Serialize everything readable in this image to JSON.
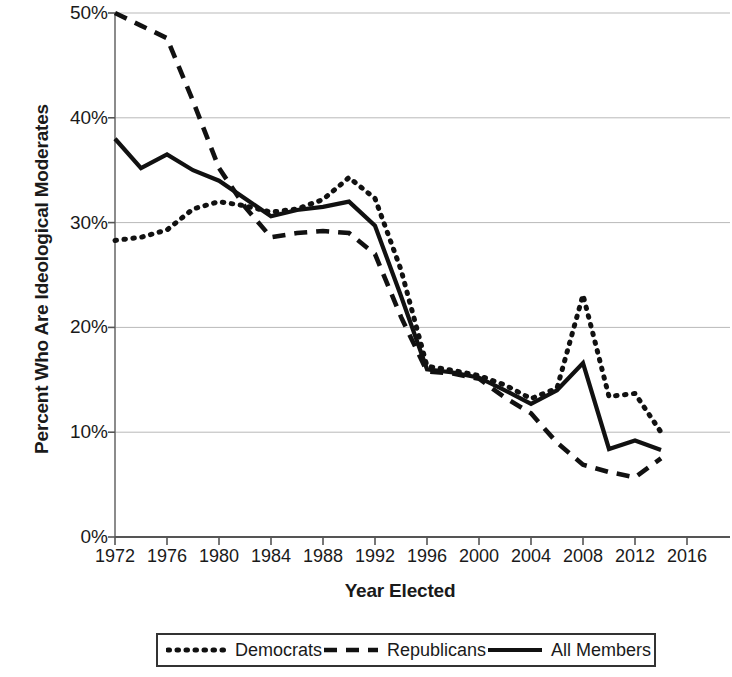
{
  "chart_data": {
    "type": "line",
    "title": "",
    "xlabel": "Year Elected",
    "ylabel": "Percent Who Are Ideological Moderates",
    "xlim": [
      1972,
      2016
    ],
    "ylim": [
      0,
      50
    ],
    "grid": true,
    "grid_axis": "y",
    "legend_position": "bottom",
    "x_tick_labels": [
      "1972",
      "1976",
      "1980",
      "1984",
      "1988",
      "1992",
      "1996",
      "2000",
      "2004",
      "2008",
      "2012",
      "2016"
    ],
    "x_ticks": [
      1972,
      1976,
      1980,
      1984,
      1988,
      1992,
      1996,
      2000,
      2004,
      2008,
      2012,
      2016
    ],
    "y_tick_labels": [
      "0%",
      "10%",
      "20%",
      "30%",
      "40%",
      "50%"
    ],
    "y_ticks": [
      0,
      10,
      20,
      30,
      40,
      50
    ],
    "x": [
      1972,
      1974,
      1976,
      1978,
      1980,
      1982,
      1984,
      1986,
      1988,
      1990,
      1992,
      1994,
      1996,
      1998,
      2000,
      2002,
      2004,
      2006,
      2008,
      2010,
      2012,
      2014
    ],
    "series": [
      {
        "name": "Democrats",
        "style": "dotted",
        "color": "#111111",
        "values": [
          28.3,
          28.6,
          29.3,
          31.3,
          32.0,
          31.6,
          31.0,
          31.3,
          32.2,
          34.3,
          32.3,
          25.5,
          16.3,
          15.9,
          15.4,
          14.5,
          13.2,
          14.2,
          23.1,
          13.4,
          13.7,
          10.0
        ]
      },
      {
        "name": "Republicans",
        "style": "dashed",
        "color": "#111111",
        "values": [
          50.0,
          48.8,
          47.6,
          41.6,
          35.2,
          31.5,
          28.6,
          29.0,
          29.2,
          29.0,
          27.0,
          21.0,
          15.8,
          15.6,
          15.1,
          13.3,
          11.8,
          9.0,
          6.9,
          6.2,
          5.7,
          7.5
        ]
      },
      {
        "name": "All Members",
        "style": "solid",
        "color": "#111111",
        "values": [
          38.0,
          35.2,
          36.5,
          35.0,
          34.0,
          32.3,
          30.6,
          31.2,
          31.5,
          32.0,
          29.7,
          23.0,
          16.0,
          15.7,
          15.2,
          14.0,
          12.7,
          14.0,
          16.6,
          8.4,
          9.2,
          8.3
        ]
      }
    ]
  },
  "axes": {
    "y_title": "Percent Who Are Ideological Moderates",
    "x_title": "Year Elected"
  },
  "legend": {
    "entries": [
      {
        "label": "Democrats",
        "icon": "dotted-line-swatch"
      },
      {
        "label": "Republicans",
        "icon": "dashed-line-swatch"
      },
      {
        "label": "All Members",
        "icon": "solid-line-swatch"
      }
    ]
  }
}
